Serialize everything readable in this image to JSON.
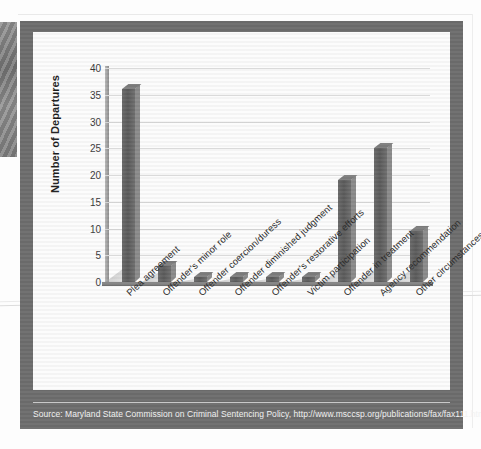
{
  "page": {
    "background_color": "#fdfdfd",
    "frame_color": "#6d6d6d",
    "card_color": "#fcfcfc"
  },
  "source": {
    "label": "Source: Maryland State Commission on Criminal Sentencing Policy, http://www.msccsp.org/publications/fax/fax111.html."
  },
  "chart_data": {
    "type": "bar",
    "title": "",
    "xlabel": "",
    "ylabel": "Number of Departures",
    "ylim": [
      0,
      40
    ],
    "yticks": [
      40,
      35,
      30,
      25,
      20,
      15,
      10,
      5,
      0
    ],
    "grid": true,
    "legend": null,
    "bar_color": "#5b5b5b",
    "style": "3d-column",
    "categories": [
      "Plea agreement",
      "Offender's minor role",
      "Offender coercion/duress",
      "Offender diminished judgment",
      "Offender's restorative efforts",
      "Victim participation",
      "Offender in treatment",
      "Agency recommendation",
      "Other circumstances"
    ],
    "values": [
      36,
      3,
      1,
      1,
      1,
      1,
      19,
      25,
      9.5
    ]
  }
}
